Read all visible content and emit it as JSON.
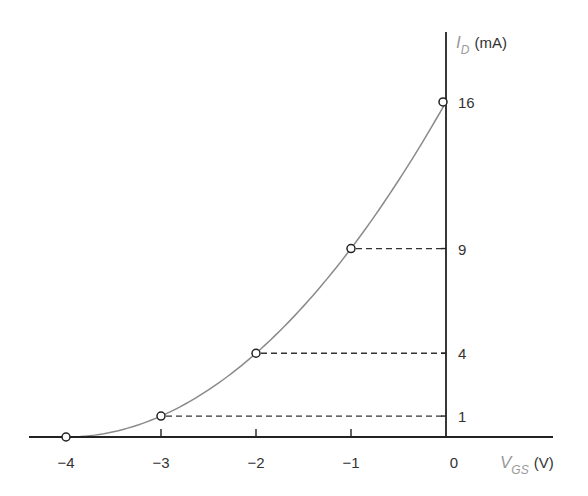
{
  "chart_data": {
    "type": "line",
    "title": "",
    "xlabel": "V_GS (V)",
    "ylabel": "I_D (mA)",
    "x_axis": {
      "variable": "V",
      "subscript": "GS",
      "unit": "(V)"
    },
    "y_axis": {
      "variable": "I",
      "subscript": "D",
      "unit": "(mA)"
    },
    "x_ticks": [
      "−4",
      "−3",
      "−2",
      "−1",
      "0"
    ],
    "x_tick_values": [
      -4,
      -3,
      -2,
      -1,
      0
    ],
    "y_ticks": [
      "1",
      "4",
      "9",
      "16"
    ],
    "y_tick_values": [
      1,
      4,
      9,
      16
    ],
    "xlim": [
      -4.4,
      1.1
    ],
    "ylim": [
      0,
      19.5
    ],
    "grid": false,
    "legend": null,
    "series": [
      {
        "name": "transfer curve",
        "description": "I_D = 16(1 - V_GS/(-4))^2",
        "x": [
          -4,
          -3,
          -2,
          -1,
          0
        ],
        "y": [
          0,
          1,
          4,
          9,
          16
        ],
        "markers": "open-circle",
        "color": "#8a8a8a"
      }
    ],
    "dashed_guides": [
      {
        "from_x": -3,
        "y": 1
      },
      {
        "from_x": -2,
        "y": 4
      },
      {
        "from_x": -1,
        "y": 9
      }
    ]
  }
}
